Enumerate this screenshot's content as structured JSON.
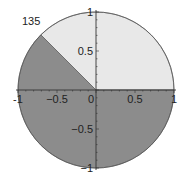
{
  "chart_data": {
    "type": "pie",
    "title": "",
    "annotation": "135",
    "slices": [
      {
        "label": "light sector",
        "start_deg": 0,
        "end_deg": 135,
        "value_deg": 135,
        "color": "#e8e8e8"
      },
      {
        "label": "dark sector",
        "start_deg": 135,
        "end_deg": 360,
        "value_deg": 225,
        "color": "#8c8c8c"
      }
    ],
    "xlim": [
      -1,
      1
    ],
    "ylim": [
      -1,
      1
    ],
    "x_ticks": [
      -1,
      -0.5,
      0,
      0.5,
      1
    ],
    "y_ticks": [
      -1,
      -0.5,
      0.5,
      1
    ],
    "x_tick_labels": [
      "-1",
      "−0.5",
      "0",
      "0.5",
      "1"
    ],
    "y_tick_labels": [
      "−1",
      "−0.5",
      "0.5",
      "1"
    ],
    "grid": false,
    "axes_through_origin": true
  },
  "layout": {
    "cx": 96,
    "cy": 90,
    "r": 78,
    "axis_color": "#333333",
    "edge_color": "#555555"
  }
}
